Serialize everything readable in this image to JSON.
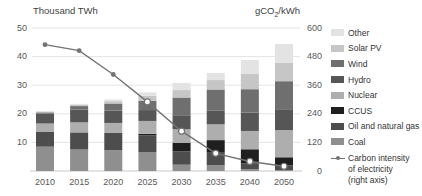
{
  "chart_data": {
    "type": "bar",
    "subtype": "stacked-bar-with-line",
    "categories": [
      "2010",
      "2015",
      "2020",
      "2025",
      "2030",
      "2035",
      "2040",
      "2050"
    ],
    "left_axis": {
      "label": "Thousand TWh",
      "min": 0,
      "max": 50,
      "ticks": [
        10,
        20,
        30,
        40,
        50
      ]
    },
    "right_axis": {
      "label_prefix": "gCO",
      "label_sub": "2",
      "label_suffix": "/kWh",
      "min": 0,
      "max": 600,
      "ticks": [
        0,
        120,
        240,
        360,
        480,
        600
      ]
    },
    "grid": "horizontal-on",
    "legend_position": "right",
    "series": [
      {
        "name": "Coal",
        "color": "#8f8f8f",
        "values": [
          8.5,
          7.5,
          7.3,
          6.5,
          2.2,
          2.0,
          0.6,
          0.3
        ]
      },
      {
        "name": "Oil and natural gas",
        "color": "#4d4d4d",
        "values": [
          5.3,
          6.0,
          6.0,
          6.0,
          4.7,
          4.4,
          2.0,
          1.7
        ]
      },
      {
        "name": "CCUS",
        "color": "#1f1f1f",
        "values": [
          0,
          0,
          0,
          0.5,
          3.0,
          4.4,
          5.0,
          2.8
        ]
      },
      {
        "name": "Nuclear",
        "color": "#aeaeae",
        "values": [
          2.8,
          3.5,
          3.5,
          4.5,
          4.7,
          5.5,
          6.4,
          9.5
        ]
      },
      {
        "name": "Hydro",
        "color": "#565656",
        "values": [
          3.5,
          4.5,
          4.3,
          3.8,
          4.9,
          4.9,
          6.4,
          7.3
        ]
      },
      {
        "name": "Wind",
        "color": "#6f6f6f",
        "values": [
          0.4,
          1.2,
          2.5,
          3.2,
          6.2,
          7.3,
          8.2,
          9.8
        ]
      },
      {
        "name": "Solar PV",
        "color": "#c6c6c6",
        "values": [
          0.1,
          0.4,
          0.8,
          1.8,
          2.6,
          3.3,
          5.3,
          6.5
        ]
      },
      {
        "name": "Other",
        "color": "#e3e3e3",
        "values": [
          0.4,
          0.4,
          0.6,
          1.2,
          2.5,
          2.5,
          4.9,
          6.5
        ]
      }
    ],
    "line_series": {
      "name": "Carbon intensity of electricity (right axis)",
      "axis": "right",
      "color": "#737373",
      "values": [
        530,
        505,
        405,
        290,
        167,
        74,
        40,
        20
      ],
      "marker_filled": [
        true,
        true,
        true,
        false,
        false,
        false,
        false,
        false
      ]
    },
    "legend_items": [
      {
        "label": "Other",
        "color": "#e3e3e3"
      },
      {
        "label": "Solar PV",
        "color": "#c6c6c6"
      },
      {
        "label": "Wind",
        "color": "#6f6f6f"
      },
      {
        "label": "Hydro",
        "color": "#565656"
      },
      {
        "label": "Nuclear",
        "color": "#aeaeae"
      },
      {
        "label": "CCUS",
        "color": "#1f1f1f"
      },
      {
        "label": "Oil and natural gas",
        "color": "#4d4d4d"
      },
      {
        "label": "Coal",
        "color": "#8f8f8f"
      }
    ],
    "legend_line_label_lines": [
      "Carbon intensity",
      "of electricity",
      "(right axis)"
    ]
  }
}
